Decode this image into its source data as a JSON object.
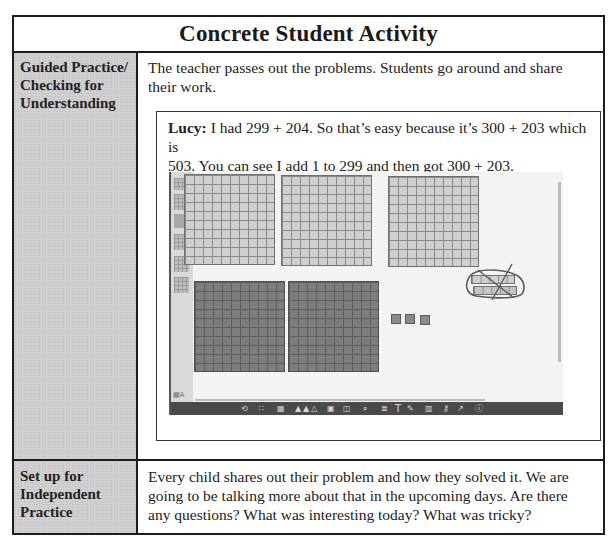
{
  "document": {
    "title": "Concrete Student Activity",
    "rows": [
      {
        "label": "Guided Practice/ Checking for Understanding",
        "label_lines": [
          "Guided Practice/",
          "Checking for",
          "Understanding"
        ],
        "text_lines": [
          "The teacher passes out the problems. Students go around and share",
          "their work."
        ],
        "example": {
          "speaker": "Lucy:",
          "line1": " I had 299 + 204. So that’s easy because it’s 300 + 203 which is",
          "line2": "503. You can see I add 1 to 299 and then got 300 + 203."
        }
      },
      {
        "label": "Set up for Independent Practice",
        "label_lines": [
          "Set up for",
          "Independent",
          "Practice"
        ],
        "text_lines": [
          "Every child shares out their problem and how they solved it. We are",
          "going to be talking more about that in the upcoming days. Are there",
          "any questions? What was interesting today? What was tricky?"
        ]
      }
    ]
  },
  "whiteboard_screenshot": {
    "description": "Virtual base-ten blocks workspace",
    "light_hundreds_flats": 3,
    "dark_hundreds_flats": 2,
    "unit_cubes": 3,
    "circled_crossed_tens_rods": 2,
    "toolbar_icons": [
      "rotate-icon",
      "grid-icon",
      "blocks-icon",
      "fill-icon",
      "fill-icon",
      "fill-icon",
      "group-icon",
      "split-icon",
      "zoom-icon",
      "list-icon",
      "text-icon",
      "pen-icon",
      "trash-icon",
      "key-icon",
      "share-icon",
      "info-icon"
    ],
    "toolbar_glyphs": [
      "⟲",
      "∷",
      "▦",
      "▲",
      "▲",
      "△",
      "▣",
      "◫",
      "⌕",
      "≣",
      "T",
      "✎",
      "▥",
      "⚷",
      "↗",
      "ⓘ"
    ]
  }
}
